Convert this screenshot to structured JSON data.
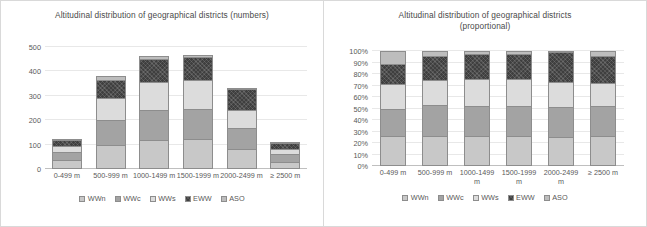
{
  "charts": [
    {
      "id": "numbers",
      "title_line1": "Altitudinal distribution of geographical districts (numbers)",
      "title_line2": "",
      "legend": [
        "WWn",
        "WWc",
        "WWs",
        "EWW",
        "ASO"
      ],
      "chart_data": {
        "type": "bar",
        "stacked": true,
        "title": "Altitudinal distribution of geographical districts (numbers)",
        "xlabel": "",
        "ylabel": "",
        "ylim": [
          0,
          550
        ],
        "yticks": [
          "0",
          "100",
          "200",
          "300",
          "400",
          "500"
        ],
        "grid": true,
        "legend_position": "bottom",
        "categories": [
          "0-499 m",
          "500-999 m",
          "1000-1499 m",
          "1500-1999 m",
          "2000-2499 m",
          "≥ 2500 m"
        ],
        "series": [
          {
            "name": "WWn",
            "values": [
              40,
              110,
              133,
              136,
              92,
              33
            ]
          },
          {
            "name": "WWc",
            "values": [
              35,
              113,
              134,
              134,
              95,
              33
            ]
          },
          {
            "name": "WWs",
            "values": [
              30,
              95,
              126,
              130,
              80,
              25
            ]
          },
          {
            "name": "EWW",
            "values": [
              25,
              85,
              105,
              105,
              94,
              28
            ]
          },
          {
            "name": "ASO",
            "values": [
              5,
              17,
              12,
              10,
              2,
              3
            ]
          }
        ],
        "totals": [
          135,
          420,
          510,
          515,
          363,
          122
        ]
      }
    },
    {
      "id": "proportional",
      "title_line1": "Altitudinal distribution of geographical districts",
      "title_line2": "(proportional)",
      "legend": [
        "WWn",
        "WWc",
        "WWs",
        "EWW",
        "ASO"
      ],
      "chart_data": {
        "type": "bar",
        "stacked": true,
        "normalized": true,
        "title": "Altitudinal distribution of geographical districts (proportional)",
        "xlabel": "",
        "ylabel": "",
        "ylim": [
          0,
          100
        ],
        "yticks": [
          "0%",
          "10%",
          "20%",
          "30%",
          "40%",
          "50%",
          "60%",
          "70%",
          "80%",
          "90%",
          "100%"
        ],
        "grid": true,
        "legend_position": "bottom",
        "categories": [
          "0-499 m",
          "500-999 m",
          "1000-1499 m",
          "1500-1999 m",
          "2000-2499 m",
          "≥ 2500 m"
        ],
        "series": [
          {
            "name": "WWn",
            "values": [
              26,
              26,
              26,
              26,
              25,
              26
            ]
          },
          {
            "name": "WWc",
            "values": [
              24,
              27,
              26,
              26,
              26,
              26
            ]
          },
          {
            "name": "WWs",
            "values": [
              21,
              22,
              24,
              24,
              22,
              20
            ]
          },
          {
            "name": "EWW",
            "values": [
              18,
              21,
              21,
              21,
              26,
              24
            ]
          },
          {
            "name": "ASO",
            "values": [
              11,
              4,
              3,
              3,
              1,
              4
            ]
          }
        ]
      }
    }
  ],
  "colors": {
    "WWn": "#c8c8c8",
    "WWc": "#a3a3a3",
    "WWs": "#dcdcdc",
    "EWW": "#3f3f3f",
    "ASO": "#bdbdbd",
    "grid": "#e8e8e8",
    "text": "#595959"
  }
}
